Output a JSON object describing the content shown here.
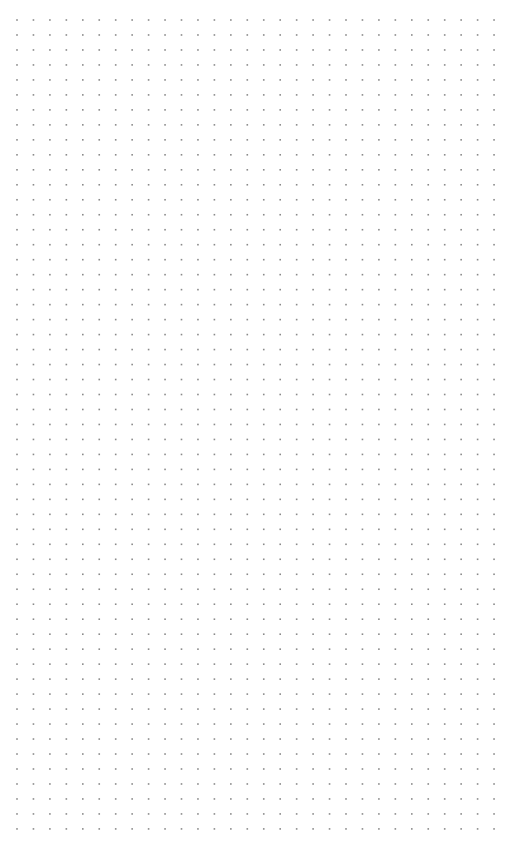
{
  "canvas": {
    "width": 531,
    "height": 863,
    "background": "#ffffff"
  },
  "dot_grid": {
    "dot_color": "#8a8a8a",
    "dot_size": 1.6,
    "origin_x": 17,
    "origin_y": 20,
    "spacing_x": 16.45,
    "spacing_y": 14.98,
    "columns": 30,
    "rows": 55
  }
}
